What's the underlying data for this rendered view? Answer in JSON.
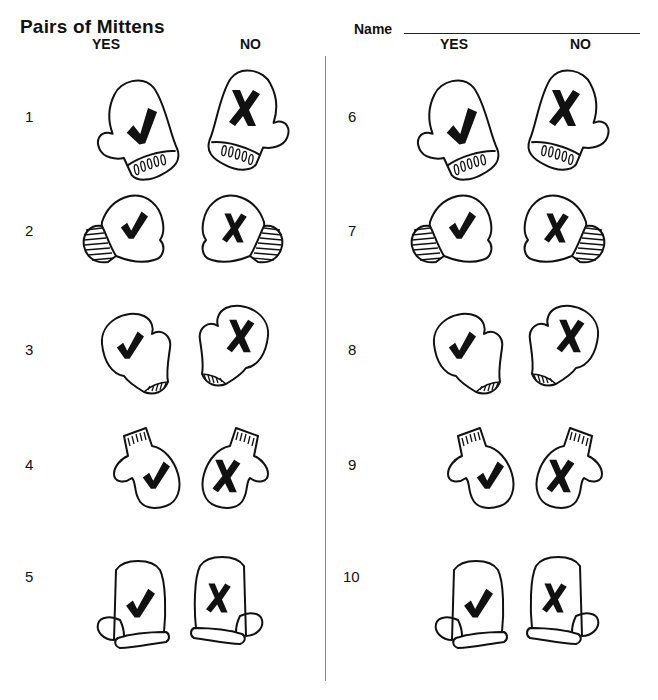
{
  "worksheet": {
    "title": "Pairs of Mittens",
    "name_label": "Name",
    "name_value": "",
    "columns": {
      "left": {
        "yes": "YES",
        "no": "NO"
      },
      "right": {
        "yes": "YES",
        "no": "NO"
      }
    }
  },
  "rows": [
    {
      "number": "1",
      "yes_mark": "check-icon",
      "no_mark": "x-icon",
      "style": "drip-cuff"
    },
    {
      "number": "2",
      "yes_mark": "check-icon",
      "no_mark": "x-icon",
      "style": "striped-cuff"
    },
    {
      "number": "3",
      "yes_mark": "check-icon",
      "no_mark": "x-icon",
      "style": "hatched-wrist"
    },
    {
      "number": "4",
      "yes_mark": "check-icon",
      "no_mark": "x-icon",
      "style": "ribbed-top"
    },
    {
      "number": "5",
      "yes_mark": "check-icon",
      "no_mark": "x-icon",
      "style": "plain-cuff"
    },
    {
      "number": "6",
      "yes_mark": "check-icon",
      "no_mark": "x-icon",
      "style": "drip-cuff"
    },
    {
      "number": "7",
      "yes_mark": "check-icon",
      "no_mark": "x-icon",
      "style": "striped-cuff"
    },
    {
      "number": "8",
      "yes_mark": "check-icon",
      "no_mark": "x-icon",
      "style": "hatched-wrist"
    },
    {
      "number": "9",
      "yes_mark": "check-icon",
      "no_mark": "x-icon",
      "style": "ribbed-top"
    },
    {
      "number": "10",
      "yes_mark": "check-icon",
      "no_mark": "x-icon",
      "style": "plain-cuff"
    }
  ]
}
